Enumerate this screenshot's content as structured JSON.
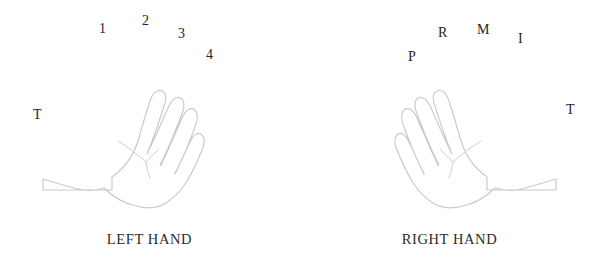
{
  "figure": {
    "background_color": "#ffffff",
    "outline_color": "#c9c9ce",
    "crease_color": "#cfcfd4",
    "text_color": "#232323"
  },
  "left_hand": {
    "caption": "LEFT HAND",
    "thumb": {
      "label": "T"
    },
    "fingers": [
      {
        "label": "1",
        "name": "index",
        "x": 99,
        "y": 22
      },
      {
        "label": "2",
        "name": "middle",
        "x": 142,
        "y": 14
      },
      {
        "label": "3",
        "name": "ring",
        "x": 178,
        "y": 27
      },
      {
        "label": "4",
        "name": "little",
        "x": 206,
        "y": 48
      }
    ],
    "thumb_label_pos": {
      "x": 33,
      "y": 108
    }
  },
  "right_hand": {
    "caption": "RIGHT HAND",
    "thumb": {
      "label": "T"
    },
    "fingers": [
      {
        "label": "P",
        "name": "little",
        "x": 408,
        "y": 50
      },
      {
        "label": "R",
        "name": "ring",
        "x": 438,
        "y": 26
      },
      {
        "label": "M",
        "name": "middle",
        "x": 477,
        "y": 23
      },
      {
        "label": "I",
        "name": "index",
        "x": 518,
        "y": 32
      }
    ],
    "thumb_label_pos": {
      "x": 566,
      "y": 103
    }
  }
}
